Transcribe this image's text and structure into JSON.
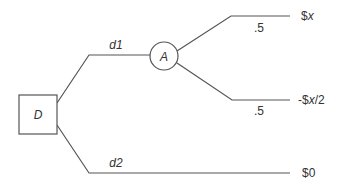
{
  "diagram": {
    "type": "decision-tree",
    "decision_node": {
      "label": "D",
      "shape": "square"
    },
    "chance_node": {
      "label": "A",
      "shape": "circle"
    },
    "branches": [
      {
        "id": "d1",
        "label": "d1",
        "from": "D",
        "to": "A"
      },
      {
        "id": "d2",
        "label": "d2",
        "from": "D",
        "payoff": "$0"
      }
    ],
    "chance_outcomes": [
      {
        "probability": ".5",
        "payoff_prefix": "$",
        "payoff_var": "x",
        "payoff_suffix": ""
      },
      {
        "probability": ".5",
        "payoff_prefix": "-$",
        "payoff_var": "x",
        "payoff_suffix": "/2"
      }
    ],
    "d2_payoff": "$0",
    "colors": {
      "line": "#555555",
      "text": "#333333",
      "background": "#ffffff"
    }
  }
}
